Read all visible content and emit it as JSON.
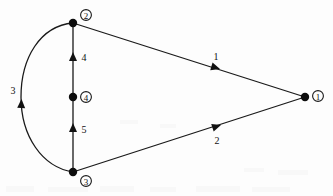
{
  "diagram": {
    "type": "directed-graph",
    "title": "",
    "background_color": "#fdfdfd",
    "stroke_color": "#111111",
    "nodes": [
      {
        "id": "1",
        "label": "①",
        "plain": "1",
        "x": 305,
        "y": 97,
        "label_x": 318,
        "label_y": 96
      },
      {
        "id": "2",
        "label": "②",
        "plain": "2",
        "x": 73,
        "y": 23,
        "label_x": 86,
        "label_y": 15
      },
      {
        "id": "3",
        "label": "③",
        "plain": "3",
        "x": 73,
        "y": 172,
        "label_x": 86,
        "label_y": 181
      },
      {
        "id": "4",
        "label": "④",
        "plain": "4",
        "x": 73,
        "y": 97,
        "label_x": 86,
        "label_y": 97
      }
    ],
    "edges": [
      {
        "id": "edge-1",
        "label": "1",
        "from": "1",
        "to": "2",
        "shape": "line",
        "label_x": 216,
        "label_y": 56,
        "arrow_x": 214,
        "arrow_y": 67,
        "arrow_angle": 197
      },
      {
        "id": "edge-2",
        "label": "2",
        "from": "1",
        "to": "3",
        "shape": "line",
        "label_x": 217,
        "label_y": 140,
        "arrow_x": 215,
        "arrow_y": 127,
        "arrow_angle": 163
      },
      {
        "id": "edge-3",
        "label": "3",
        "from": "2",
        "to": "3",
        "shape": "curve",
        "label_x": 14,
        "label_y": 90,
        "arrow_x": 23,
        "arrow_y": 94,
        "arrow_angle": 93
      },
      {
        "id": "edge-4",
        "label": "4",
        "from": "2",
        "to": "4",
        "shape": "line",
        "label_x": 84,
        "label_y": 57,
        "arrow_x": 73,
        "arrow_y": 58,
        "arrow_angle": 90
      },
      {
        "id": "edge-5",
        "label": "5",
        "from": "4",
        "to": "3",
        "shape": "line",
        "label_x": 84,
        "label_y": 129,
        "arrow_x": 73,
        "arrow_y": 129,
        "arrow_angle": 90
      }
    ]
  }
}
